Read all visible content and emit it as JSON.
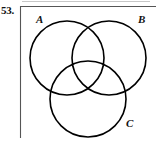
{
  "figure": {
    "exercise_number": "53.",
    "type": "venn-diagram",
    "set_count": 3,
    "labels": {
      "a": "A",
      "b": "B",
      "c": "C"
    },
    "colors": {
      "background": "#ffffff",
      "stroke": "#000000",
      "frame": "#555555",
      "text": "#111111"
    },
    "geometry": {
      "width": 156,
      "height": 142,
      "circle_a": {
        "cx": 67,
        "cy": 58,
        "r": 37
      },
      "circle_b": {
        "cx": 109,
        "cy": 58,
        "r": 37
      },
      "circle_c": {
        "cx": 88,
        "cy": 99,
        "r": 38
      },
      "label_a": {
        "x": 36,
        "y": 23
      },
      "label_b": {
        "x": 138,
        "y": 23
      },
      "label_c": {
        "x": 126,
        "y": 127
      },
      "frame_vertical": {
        "x": 20.5,
        "y1": 6,
        "y2": 138
      },
      "frame_top": {
        "x1": 20.5,
        "y1": 6.5,
        "x2": 156,
        "y2": 6.5
      }
    }
  }
}
